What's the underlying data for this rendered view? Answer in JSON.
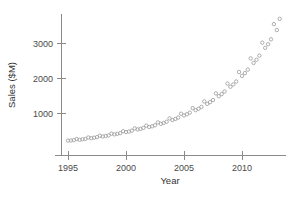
{
  "chart_data": {
    "type": "scatter",
    "title": "",
    "xlabel": "Year",
    "ylabel": "Sales ($M)",
    "xlim": [
      1994.3,
      1994.3
    ],
    "ylim": [
      0,
      3900
    ],
    "xticks": [
      1995,
      2000,
      2005,
      2010
    ],
    "xtick_labels": [
      "1995",
      "2000",
      "2005",
      "2010"
    ],
    "yticks": [
      1000,
      2000,
      3000
    ],
    "ytick_labels": [
      "1000",
      "2000",
      "3000"
    ],
    "grid": false,
    "legend": "none",
    "marker": "open-circle",
    "marker_color": "#9a9a9a",
    "series_name": "Quarterly sales",
    "x": [
      1995.0,
      1995.25,
      1995.5,
      1995.75,
      1996.0,
      1996.25,
      1996.5,
      1996.75,
      1997.0,
      1997.25,
      1997.5,
      1997.75,
      1998.0,
      1998.25,
      1998.5,
      1998.75,
      1999.0,
      1999.25,
      1999.5,
      1999.75,
      2000.0,
      2000.25,
      2000.5,
      2000.75,
      2001.0,
      2001.25,
      2001.5,
      2001.75,
      2002.0,
      2002.25,
      2002.5,
      2002.75,
      2003.0,
      2003.25,
      2003.5,
      2003.75,
      2004.0,
      2004.25,
      2004.5,
      2004.75,
      2005.0,
      2005.25,
      2005.5,
      2005.75,
      2006.0,
      2006.25,
      2006.5,
      2006.75,
      2007.0,
      2007.25,
      2007.5,
      2007.75,
      2008.0,
      2008.25,
      2008.5,
      2008.75,
      2009.0,
      2009.25,
      2009.5,
      2009.75,
      2010.0,
      2010.25,
      2010.5,
      2010.75,
      2011.0,
      2011.25,
      2011.5,
      2011.75,
      2012.0,
      2012.25,
      2012.5,
      2012.75,
      2013.0,
      2013.25
    ],
    "y": [
      210,
      215,
      225,
      255,
      235,
      250,
      260,
      300,
      280,
      295,
      310,
      350,
      330,
      345,
      360,
      410,
      390,
      405,
      425,
      480,
      455,
      470,
      495,
      560,
      530,
      545,
      575,
      640,
      600,
      620,
      650,
      730,
      690,
      715,
      750,
      845,
      800,
      830,
      870,
      980,
      930,
      965,
      1010,
      1140,
      1080,
      1120,
      1175,
      1330,
      1260,
      1310,
      1370,
      1560,
      1480,
      1540,
      1615,
      1840,
      1750,
      1815,
      1900,
      2170,
      2060,
      2140,
      2240,
      2560,
      2430,
      2520,
      2640,
      3010,
      2860,
      2965,
      3105,
      3540,
      3370,
      3690
    ],
    "point_count": 74,
    "x_range_note": "1995-2013 quarterly"
  },
  "axes": {
    "y_title": "Sales ($M)",
    "x_title": "Year"
  }
}
